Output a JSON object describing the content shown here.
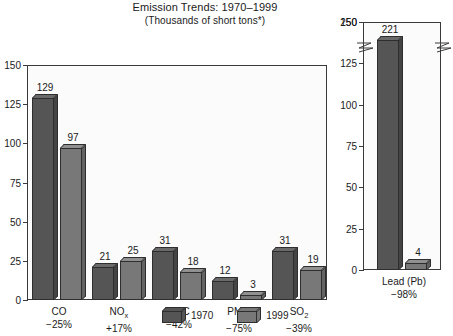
{
  "chart_data": {
    "type": "bar",
    "title": "Emission Trends: 1970–1999",
    "subtitle": "(Thousands of short tons*)",
    "xlabel": "",
    "ylabel": "",
    "grid": false,
    "legend_position": "bottom-center",
    "panels": [
      {
        "name": "main",
        "categories": [
          "CO",
          "NOₓ",
          "VOC",
          "PM₁₀",
          "SO₂"
        ],
        "category_labels": [
          {
            "base": "CO",
            "sub": "",
            "pct": "−25%"
          },
          {
            "base": "NO",
            "sub": "x",
            "pct": "+17%"
          },
          {
            "base": "VOC",
            "sub": "",
            "pct": "−42%"
          },
          {
            "base": "PM",
            "sub": "10",
            "pct": "−75%"
          },
          {
            "base": "SO",
            "sub": "2",
            "pct": "−39%"
          }
        ],
        "ylim": [
          0,
          150
        ],
        "yticks": [
          0,
          25,
          50,
          75,
          100,
          125,
          150
        ],
        "series": [
          {
            "name": "1970",
            "values": [
              129,
              21,
              31,
              12,
              31
            ]
          },
          {
            "name": "1999",
            "values": [
              97,
              25,
              18,
              3,
              19
            ]
          }
        ]
      },
      {
        "name": "lead",
        "categories": [
          "Lead (Pb)"
        ],
        "category_labels": [
          {
            "base": "Lead (Pb)",
            "sub": "",
            "pct": "−98%"
          }
        ],
        "ylim": [
          0,
          150
        ],
        "yticks": [
          0,
          25,
          50,
          75,
          100,
          125,
          150
        ],
        "broken_axis": true,
        "break_top_tick": 250,
        "series": [
          {
            "name": "1970",
            "values": [
              221
            ]
          },
          {
            "name": "1999",
            "values": [
              4
            ]
          }
        ]
      }
    ],
    "legend": [
      {
        "label": "1970",
        "color": "#555555"
      },
      {
        "label": "1999",
        "color": "#787878"
      }
    ],
    "colors": {
      "series_1970": "#555555",
      "series_1999": "#787878",
      "axis": "#3a3a3a",
      "text": "#1a1a1a",
      "plot_background": "#fbfbfb"
    }
  }
}
